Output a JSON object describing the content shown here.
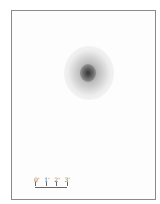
{
  "figure": {
    "scale_bar": {
      "labels": [
        "0'",
        "1'",
        "2'",
        "3'"
      ]
    }
  }
}
